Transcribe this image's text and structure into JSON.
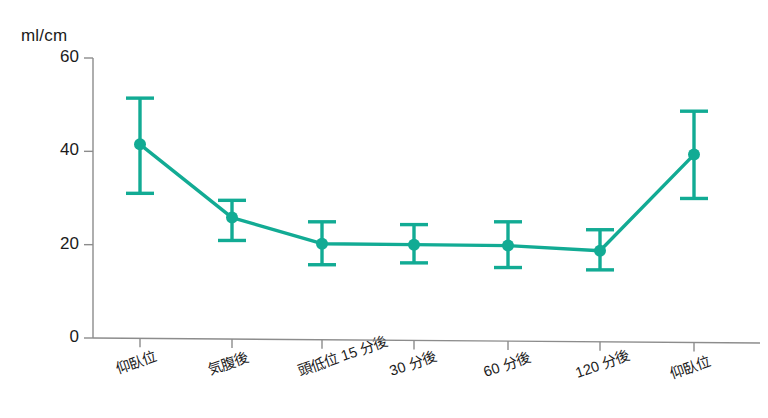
{
  "chart_data": {
    "type": "line",
    "title": "",
    "subtitle": "",
    "xlabel": "",
    "ylabel": "ml/cm",
    "unit_label": "ml/cm",
    "ylim": [
      0,
      60
    ],
    "yticks": [
      0,
      20,
      40,
      60
    ],
    "ytick_labels": [
      "0",
      "20",
      "40",
      "60"
    ],
    "grid": false,
    "legend": false,
    "legend_position": "none",
    "error_bars": true,
    "series_color": "#12ab94",
    "axis_color": "#8c8c8c",
    "categories": [
      "仰臥位",
      "気腹後",
      "頭低位 15 分後",
      "30 分後",
      "60 分後",
      "120 分後",
      "仰臥位"
    ],
    "series": [
      {
        "name": "ml/cm",
        "values": [
          41.5,
          25.8,
          20.2,
          20.0,
          19.8,
          18.7,
          39.3
        ],
        "err_upper": [
          51.4,
          29.5,
          24.9,
          24.3,
          24.9,
          23.2,
          48.6
        ],
        "err_lower": [
          31.0,
          20.9,
          15.7,
          16.1,
          15.1,
          14.6,
          29.9
        ]
      }
    ],
    "annotations": []
  },
  "geometry": {
    "axis_x": 93,
    "axis_y_baseline": 338,
    "y_top": 58,
    "x_positions": [
      140,
      232,
      322,
      414,
      508,
      600,
      694
    ],
    "x_axis_end": 760
  }
}
